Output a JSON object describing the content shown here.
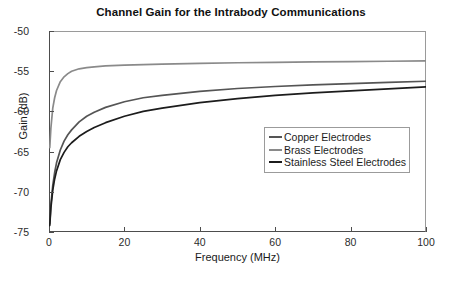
{
  "chart_data": {
    "type": "line",
    "title": "Channel Gain for the Intrabody Communications",
    "xlabel": "Frequency (MHz)",
    "ylabel": "Gain (dB)",
    "xlim": [
      0,
      100
    ],
    "ylim": [
      -75,
      -50
    ],
    "xticks": [
      0,
      20,
      40,
      60,
      80,
      100
    ],
    "yticks": [
      -50,
      -55,
      -60,
      -65,
      -70,
      -75
    ],
    "xtick_labels": [
      "0",
      "20",
      "40",
      "60",
      "80",
      "100"
    ],
    "ytick_labels": [
      "-50",
      "-55",
      "-60",
      "-65",
      "-70",
      "-75"
    ],
    "grid": false,
    "legend_position": "center-right",
    "x": [
      0.2,
      0.5,
      1,
      1.5,
      2,
      3,
      4,
      5,
      6,
      8,
      10,
      12,
      15,
      20,
      25,
      30,
      40,
      50,
      60,
      70,
      80,
      90,
      100
    ],
    "series": [
      {
        "name": "Brass Electrodes",
        "color": "#8a8a8a",
        "values": [
          -64.5,
          -62.1,
          -59.6,
          -58.3,
          -57.4,
          -56.3,
          -55.7,
          -55.3,
          -55.0,
          -54.7,
          -54.55,
          -54.45,
          -54.35,
          -54.25,
          -54.18,
          -54.12,
          -54.02,
          -53.95,
          -53.89,
          -53.84,
          -53.8,
          -53.76,
          -53.72
        ]
      },
      {
        "name": "Copper Electrodes",
        "color": "#555555",
        "values": [
          -74.0,
          -71.6,
          -69.2,
          -67.6,
          -66.4,
          -64.8,
          -63.7,
          -62.9,
          -62.3,
          -61.3,
          -60.6,
          -60.1,
          -59.5,
          -58.8,
          -58.3,
          -58.0,
          -57.5,
          -57.15,
          -56.9,
          -56.7,
          -56.55,
          -56.4,
          -56.25
        ]
      },
      {
        "name": "Stainless Steel Electrodes",
        "color": "#1c1c1c",
        "values": [
          -74.2,
          -72.0,
          -69.8,
          -68.4,
          -67.4,
          -66.0,
          -65.1,
          -64.4,
          -63.9,
          -63.1,
          -62.5,
          -62.0,
          -61.4,
          -60.6,
          -60.0,
          -59.6,
          -58.9,
          -58.4,
          -58.0,
          -57.7,
          -57.45,
          -57.2,
          -56.95
        ]
      }
    ]
  },
  "legend": {
    "items": [
      {
        "label": "Copper Electrodes",
        "color": "#555555"
      },
      {
        "label": "Brass Electrodes",
        "color": "#8a8a8a"
      },
      {
        "label": "Stainless Steel Electrodes",
        "color": "#1c1c1c"
      }
    ]
  },
  "caption": {
    "text": ""
  }
}
